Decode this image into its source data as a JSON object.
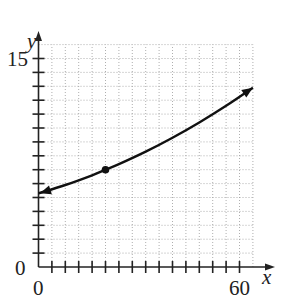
{
  "chart_data": {
    "type": "line",
    "title": "",
    "xlabel": "x",
    "ylabel": "y",
    "xlim": [
      0,
      64
    ],
    "ylim": [
      0,
      16
    ],
    "x_tick_labels": [
      "0",
      "60"
    ],
    "y_tick_labels": [
      "0",
      "15"
    ],
    "x_tick_step": 4,
    "y_tick_step": 1,
    "grid": true,
    "grid_style": "dotted",
    "legend": null,
    "series": [
      {
        "name": "curve",
        "model": "y = 5.3 * 1.014^x",
        "x": [
          0,
          8,
          16,
          20,
          24,
          32,
          40,
          48,
          56,
          64
        ],
        "values": [
          5.3,
          5.9,
          6.6,
          7.0,
          7.4,
          8.3,
          9.3,
          10.4,
          11.6,
          12.9
        ],
        "arrows": "both"
      }
    ],
    "annotations": [
      {
        "type": "point",
        "x": 20,
        "y": 7,
        "style": "filled-dot"
      }
    ]
  },
  "labels": {
    "x_axis": "x",
    "y_axis": "y",
    "x_origin": "0",
    "y_origin": "0",
    "x_max": "60",
    "y_max": "15"
  }
}
